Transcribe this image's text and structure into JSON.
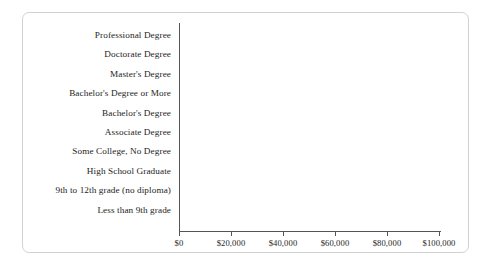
{
  "figure": {
    "frame_border_color": "#d2d2d2",
    "background_color": "#ffffff",
    "bar_color": "#6e6e6e",
    "axis_color": "#555555"
  },
  "chart_data": {
    "type": "bar",
    "orientation": "horizontal",
    "title": "",
    "xlabel": "",
    "ylabel": "",
    "grid": false,
    "legend": null,
    "xlim": [
      0,
      100000
    ],
    "xticks": [
      0,
      20000,
      40000,
      60000,
      80000,
      100000
    ],
    "xtick_labels": [
      "$0",
      "$20,000",
      "$40,000",
      "$60,000",
      "$80,000",
      "$100,000"
    ],
    "categories": [
      "Professional Degree",
      "Doctorate Degree",
      "Master's Degree",
      "Bachelor's Degree or More",
      "Bachelor's Degree",
      "Associate Degree",
      "Some College, No Degree",
      "High School Graduate",
      "9th to 12th grade (no diploma)",
      "Less than 9th grade"
    ],
    "values": [
      101000,
      101000,
      92000,
      85000,
      78000,
      59000,
      53000,
      45000,
      30000,
      26000
    ]
  }
}
